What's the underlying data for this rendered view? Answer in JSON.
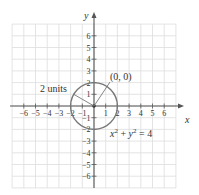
{
  "chart_data": {
    "type": "line",
    "title": "",
    "xlabel": "x",
    "ylabel": "y",
    "xlim": [
      -7,
      7
    ],
    "ylim": [
      -7,
      7
    ],
    "grid": true,
    "x_ticks": [
      -6,
      -5,
      -4,
      -3,
      -2,
      -1,
      1,
      2,
      3,
      4,
      5,
      6
    ],
    "y_ticks": [
      -6,
      -5,
      -4,
      -3,
      -2,
      -1,
      1,
      2,
      3,
      4,
      5,
      6
    ],
    "x_tick_labels": [
      "−6",
      "−5",
      "−4",
      "−3",
      "−2",
      "−1",
      "1",
      "2",
      "3",
      "4",
      "5",
      "6"
    ],
    "y_tick_labels": [
      "−6",
      "−5",
      "−4",
      "−3",
      "−2",
      "−1",
      "1",
      "2",
      "3",
      "4",
      "5",
      "6"
    ],
    "series": [
      {
        "name": "circle",
        "equation": "x^2 + y^2 = 4",
        "center": [
          0,
          0
        ],
        "radius": 2
      }
    ],
    "annotations": [
      {
        "text": "(0, 0)",
        "target": [
          0,
          0
        ],
        "label_pos": [
          1.3,
          2.3
        ]
      },
      {
        "text": "2 units",
        "target": "radius",
        "label_pos": [
          -4.6,
          1.3
        ]
      },
      {
        "text": "x² + y² = 4",
        "label_pos": [
          1.6,
          -2.2
        ]
      }
    ]
  },
  "labels": {
    "x_axis": "x",
    "y_axis": "y",
    "center_point": "(0, 0)",
    "radius_label": "2 units",
    "equation_x": "x",
    "equation_y": "y",
    "equation_sup": "2",
    "equation_rest": " = 4",
    "equation_plus": " + "
  },
  "colors": {
    "grid": "#dddddd",
    "axis": "#555555",
    "circle": "#777777",
    "text": "#333333"
  }
}
